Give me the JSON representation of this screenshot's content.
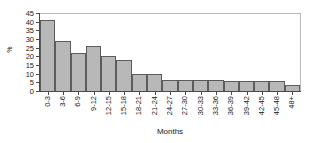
{
  "chart_data": {
    "type": "bar",
    "title": "",
    "xlabel": "Months",
    "ylabel": "%",
    "categories": [
      "0-3",
      "3-6",
      "6-9",
      "9-12",
      "12-15",
      "15-18",
      "18-21",
      "21-24",
      "24-27",
      "27-30",
      "30-33",
      "33-36",
      "36-39",
      "39-42",
      "42-45",
      "45-48",
      "48+"
    ],
    "values": [
      41,
      29,
      22,
      26,
      20,
      18,
      10,
      10,
      6.5,
      6.5,
      6.5,
      6.5,
      5.5,
      5.5,
      5.5,
      5.5,
      3.5
    ],
    "ylim": [
      0,
      45
    ],
    "yticks": [
      0,
      5,
      10,
      15,
      20,
      25,
      30,
      35,
      40,
      45
    ],
    "ytick_labels": [
      "0",
      "5",
      "10",
      "15",
      "20",
      "25",
      "30",
      "35",
      "40",
      "45"
    ],
    "grid": false,
    "legend": "none",
    "bar_fill_color": "#b8b8b8",
    "bar_border_color": "#5c5c5c",
    "axis_color": "#4a4a4a",
    "plot_border_color": "#b9b9b9",
    "background_color": "#ffffff"
  }
}
